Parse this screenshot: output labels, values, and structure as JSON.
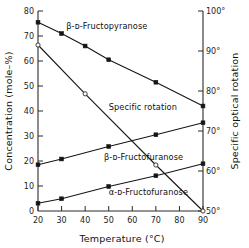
{
  "chart_data": {
    "type": "line",
    "title": "",
    "xlabel": "Temperature (°C)",
    "ylabel": "Concentration (mole–%)",
    "y2label": "Specific optical rotation",
    "xlim": [
      20,
      90
    ],
    "ylim": [
      0,
      80
    ],
    "y2lim": [
      100,
      50
    ],
    "xticks": [
      20,
      30,
      40,
      50,
      60,
      70,
      80,
      90
    ],
    "xticklabels": [
      "20",
      "30",
      "40",
      "50",
      "60",
      "70",
      "80",
      "90"
    ],
    "yticks": [
      0,
      10,
      20,
      30,
      40,
      50,
      60,
      70,
      80
    ],
    "yticklabels": [
      "0",
      "10",
      "20",
      "30",
      "40",
      "50",
      "60",
      "70",
      "80"
    ],
    "y2ticks": [
      50,
      60,
      70,
      80,
      90,
      100
    ],
    "y2ticklabels": [
      "50°",
      "60°",
      "70°",
      "80°",
      "90°",
      "100°"
    ],
    "grid": false,
    "legend_position": "inline-annotations",
    "series": [
      {
        "name": "β-ᴅ-Fructopyranose",
        "label": "β-ᴅ-Fructopyranose",
        "axis": "left",
        "marker": "filled-square",
        "x": [
          20,
          30,
          40,
          50,
          70,
          90
        ],
        "values": [
          75.5,
          71,
          66,
          60.5,
          51.5,
          42
        ]
      },
      {
        "name": "β-ᴅ-Fructofuranose",
        "label": "β-ᴅ-Fructofuranose",
        "axis": "left",
        "marker": "filled-square",
        "x": [
          20,
          30,
          50,
          70,
          90
        ],
        "values": [
          18.5,
          20.8,
          25.8,
          30.5,
          35.3
        ]
      },
      {
        "name": "α-ᴅ-Fructofuranose",
        "label": "α-ᴅ-Fructofuranose",
        "axis": "left",
        "marker": "filled-square",
        "x": [
          20,
          30,
          50,
          70,
          90
        ],
        "values": [
          3.1,
          4.9,
          9.8,
          14.1,
          18.9
        ]
      },
      {
        "name": "Specific rotation",
        "label": "Specific rotation",
        "axis": "right",
        "marker": "open-circle",
        "x": [
          20,
          40,
          70,
          90
        ],
        "values": [
          91.5,
          79.3,
          61.5,
          50.0
        ]
      }
    ],
    "annotations": [
      {
        "text": "β-ᴅ-Fructopyranose",
        "x": 32,
        "y": 74
      },
      {
        "text": "Specific rotation",
        "x": 50,
        "y": 41.5
      },
      {
        "text": "β-ᴅ-Fructofuranose",
        "x": 48,
        "y": 21.5
      },
      {
        "text": "α-ᴅ-Fructofuranose",
        "x": 50,
        "y": 7.5
      }
    ]
  },
  "axes": {
    "x_title": "Temperature (°C)",
    "y_left_title": "Concentration (mole–%)",
    "y_right_title": "Specific optical rotation",
    "zero_label": "0"
  },
  "colors": {
    "background": "#ffffff",
    "axis": "#2b2b2b",
    "line": "#161616",
    "marker_fill": "#141414",
    "marker_open_fill": "#ffffff",
    "text": "#111111"
  }
}
